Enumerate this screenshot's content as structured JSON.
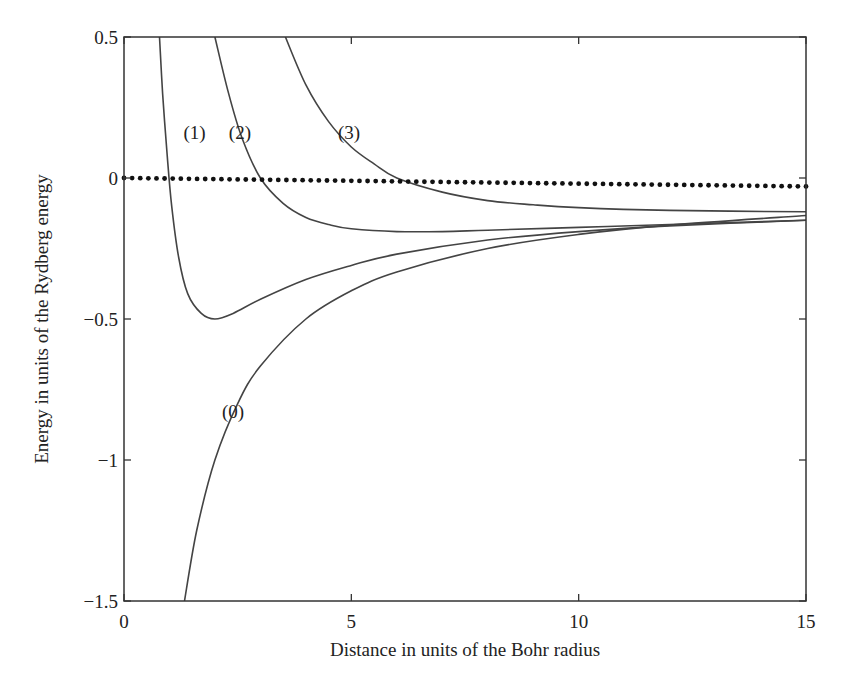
{
  "chart_data": {
    "type": "line",
    "title": "",
    "xlabel": "Distance in units of the Bohr radius",
    "ylabel": "Energy in units of the  Rydberg energy",
    "xlim": [
      0,
      15
    ],
    "ylim": [
      -1.5,
      0.5
    ],
    "xticks": [
      0,
      5,
      10,
      15
    ],
    "xtick_labels": [
      "0",
      "5",
      "10",
      "15"
    ],
    "yticks": [
      0.5,
      0,
      -0.5,
      -1,
      -1.5
    ],
    "ytick_labels": [
      "0.5",
      "0",
      "−0.5",
      "−1",
      "−1.5"
    ],
    "grid": false,
    "legend": "none",
    "series": [
      {
        "name": "(0)",
        "label_pos": [
          2.4,
          -0.85
        ],
        "x": [
          1.33,
          1.6,
          2.0,
          2.5,
          3.0,
          4.0,
          5.0,
          6.0,
          8.0,
          10.0,
          12.0,
          15.0
        ],
        "y": [
          -1.5,
          -1.25,
          -1.0,
          -0.8,
          -0.667,
          -0.5,
          -0.4,
          -0.333,
          -0.25,
          -0.2,
          -0.167,
          -0.133
        ]
      },
      {
        "name": "(1)",
        "label_pos": [
          1.55,
          0.14
        ],
        "x": [
          0.78,
          0.85,
          0.95,
          1.05,
          1.2,
          1.4,
          1.7,
          2.0,
          2.4,
          3.0,
          4.0,
          5.0,
          6.0,
          8.0,
          10.0,
          12.0,
          15.0
        ],
        "y": [
          0.5,
          0.3,
          0.08,
          -0.1,
          -0.28,
          -0.41,
          -0.48,
          -0.5,
          -0.48,
          -0.43,
          -0.36,
          -0.31,
          -0.27,
          -0.22,
          -0.19,
          -0.17,
          -0.15
        ]
      },
      {
        "name": "(2)",
        "label_pos": [
          2.55,
          0.14
        ],
        "x": [
          2.0,
          2.3,
          2.6,
          3.0,
          3.5,
          4.0,
          4.5,
          5.0,
          6.0,
          7.0,
          8.0,
          10.0,
          12.0,
          15.0
        ],
        "y": [
          0.5,
          0.3,
          0.14,
          0.0,
          -0.09,
          -0.14,
          -0.165,
          -0.18,
          -0.19,
          -0.19,
          -0.185,
          -0.175,
          -0.165,
          -0.15
        ]
      },
      {
        "name": "(3)",
        "label_pos": [
          4.95,
          0.14
        ],
        "x": [
          3.55,
          4.0,
          4.5,
          5.0,
          5.5,
          6.0,
          7.0,
          8.0,
          9.0,
          10.0,
          12.0,
          15.0
        ],
        "y": [
          0.5,
          0.33,
          0.2,
          0.11,
          0.05,
          0.0,
          -0.05,
          -0.08,
          -0.095,
          -0.105,
          -0.115,
          -0.12
        ]
      },
      {
        "name": "dotted-zero",
        "style": "dotted",
        "x": [
          0,
          15
        ],
        "y": [
          0.0,
          -0.03
        ]
      }
    ]
  }
}
